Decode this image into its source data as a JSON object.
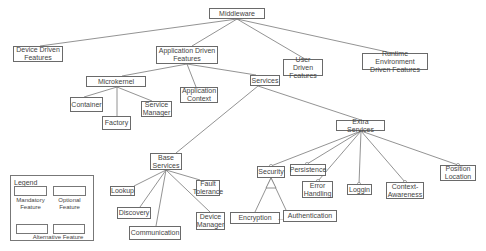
{
  "diagram": {
    "type": "feature-model",
    "nodes": {
      "middleware": "Middleware",
      "device_driven": "Device Driven\nFeatures",
      "application_driven": "Application Driven\nFeatures",
      "user_driven": "User Driven\nFeatures",
      "runtime_env": "Runtime Environment\nDriven Features",
      "microkernel": "Microkernel",
      "application_context": "Application\nContext",
      "services": "Services",
      "container": "Container",
      "service_manager": "Service\nManager",
      "factory": "Factory",
      "extra_services": "Extra Services",
      "base_services": "Base\nServices",
      "lookup": "Lookup",
      "fault_tolerance": "Fault\nTolerance",
      "discovery": "Discovery",
      "communication": "Communication",
      "device_manager": "Device\nManager",
      "security": "Security",
      "persistence": "Persistence",
      "error_handling": "Error\nHandling",
      "loggin": "Loggin",
      "context_awareness": "Context-\nAwareness",
      "position_location": "Position\nLocation",
      "encryption": "Encryption",
      "authentication": "Authentication"
    },
    "ellipsis": "...",
    "legend": {
      "title": "Legend",
      "mandatory": "Mandatory\nFeature",
      "optional": "Optional\nFeature",
      "alternative": "Alternative Feature"
    }
  }
}
